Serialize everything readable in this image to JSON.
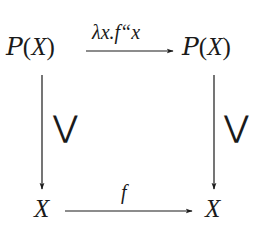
{
  "diagram": {
    "type": "commutative-square",
    "nodes": {
      "top_left": {
        "script": "P",
        "open": "(",
        "var": "X",
        "close": ")"
      },
      "top_right": {
        "script": "P",
        "open": "(",
        "var": "X",
        "close": ")"
      },
      "bottom_left": {
        "var": "X"
      },
      "bottom_right": {
        "var": "X"
      }
    },
    "arrows": {
      "top": {
        "label": "λx.f“x",
        "from": "P(X)",
        "to": "P(X)"
      },
      "bottom": {
        "label": "f",
        "from": "X",
        "to": "X"
      },
      "left": {
        "label": "⋁",
        "from": "P(X)",
        "to": "X"
      },
      "right": {
        "label": "⋁",
        "from": "P(X)",
        "to": "X"
      }
    },
    "colors": {
      "ink": "#1a1a1a",
      "background": "#ffffff"
    }
  }
}
